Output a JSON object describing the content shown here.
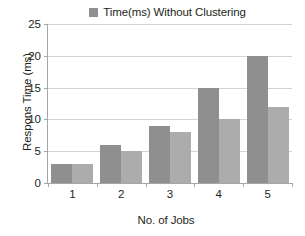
{
  "chart_data": {
    "type": "bar",
    "title": "",
    "xlabel": "No. of Jobs",
    "ylabel": "Respons Time (ms)",
    "categories": [
      "1",
      "2",
      "3",
      "4",
      "5"
    ],
    "ylim": [
      0,
      25
    ],
    "yticks": [
      "0",
      "5",
      "10",
      "15",
      "20",
      "25"
    ],
    "grid": true,
    "legend_position": "top-center",
    "series": [
      {
        "name": "Time(ms) Without Clustering",
        "color": "#8f8f8f",
        "values": [
          3,
          6,
          9,
          15,
          20
        ]
      },
      {
        "name": "",
        "color": "#acacac",
        "values": [
          3,
          5,
          8,
          10,
          12
        ]
      }
    ]
  },
  "legend": {
    "entries": [
      {
        "label": "Time(ms) Without Clustering",
        "swatch_color": "#8f8f8f"
      }
    ]
  },
  "axes": {
    "y_title": "Respons Time (ms)",
    "x_title": "No. of Jobs",
    "y_tick_labels": [
      "25",
      "20",
      "15",
      "10",
      "5",
      "0"
    ],
    "x_tick_labels": [
      "1",
      "2",
      "3",
      "4",
      "5"
    ],
    "axis_color": "#a6a6a6",
    "grid_color": "#d4d4d4"
  }
}
